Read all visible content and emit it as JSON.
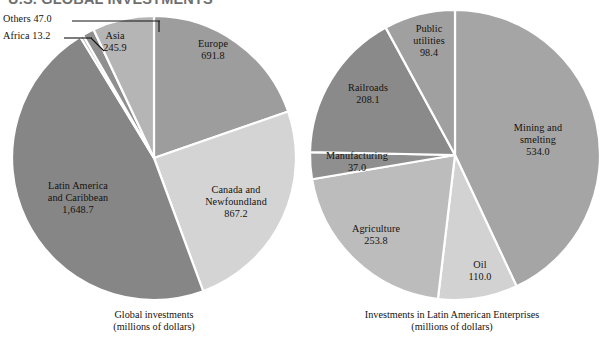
{
  "figure": {
    "title": "U.S. GLOBAL INVESTMENTS",
    "title_color": "#6f6f6f",
    "background": "#ffffff"
  },
  "chart_data": [
    {
      "type": "pie",
      "id": "global-investments",
      "title": "Global investments",
      "subtitle": "(millions of dollars)",
      "unit": "millions of dollars",
      "total": 3513.6,
      "start_angle_deg": -90,
      "direction": "clockwise",
      "center": {
        "x": 154,
        "y": 158
      },
      "radius": 142,
      "categories": [
        "Europe",
        "Canada and Newfoundland",
        "Latin America and Caribbean",
        "Africa",
        "Others",
        "Asia"
      ],
      "values": [
        691.8,
        867.2,
        1648.7,
        13.2,
        47.0,
        245.9
      ],
      "colors": [
        "#9d9d9d",
        "#d4d4d4",
        "#868686",
        "#bdbdbd",
        "#8f8f8f",
        "#b5b5b5"
      ],
      "slices": [
        {
          "label": "Europe",
          "label_line2": "",
          "value": "691.8",
          "number": 691.8,
          "color": "#9d9d9d",
          "label_placement": "inside"
        },
        {
          "label": "Canada and",
          "label_line2": "Newfoundland",
          "value": "867.2",
          "number": 867.2,
          "color": "#d4d4d4",
          "label_placement": "inside"
        },
        {
          "label": "Latin America",
          "label_line2": "and Caribbean",
          "value": "1,648.7",
          "number": 1648.7,
          "color": "#868686",
          "label_placement": "inside"
        },
        {
          "label": "Africa",
          "label_line2": "",
          "value": "13.2",
          "number": 13.2,
          "color": "#bdbdbd",
          "label_placement": "outside-left"
        },
        {
          "label": "Others",
          "label_line2": "",
          "value": "47.0",
          "number": 47.0,
          "color": "#8f8f8f",
          "label_placement": "outside-left"
        },
        {
          "label": "Asia",
          "label_line2": "",
          "value": "245.9",
          "number": 245.9,
          "color": "#b5b5b5",
          "label_placement": "inside"
        }
      ],
      "legend": "none",
      "grid": false
    },
    {
      "type": "pie",
      "id": "latin-american-enterprises",
      "title": "Investments in Latin American Enterprises",
      "subtitle": "(millions of dollars)",
      "unit": "millions of dollars",
      "total": 1241.3,
      "start_angle_deg": -90,
      "direction": "clockwise",
      "center": {
        "x": 455,
        "y": 155
      },
      "radius": 145,
      "categories": [
        "Mining and smelting",
        "Oil",
        "Agriculture",
        "Manufacturing",
        "Railroads",
        "Public utilities"
      ],
      "values": [
        534.0,
        110.0,
        253.8,
        37.0,
        208.1,
        98.4
      ],
      "colors": [
        "#a5a5a5",
        "#d2d2d2",
        "#bcbcbc",
        "#8f8f8f",
        "#8a8a8a",
        "#a0a0a0"
      ],
      "slices": [
        {
          "label": "Mining and",
          "label_line2": "smelting",
          "value": "534.0",
          "number": 534.0,
          "color": "#a5a5a5",
          "label_placement": "inside"
        },
        {
          "label": "Oil",
          "label_line2": "",
          "value": "110.0",
          "number": 110.0,
          "color": "#d2d2d2",
          "label_placement": "inside"
        },
        {
          "label": "Agriculture",
          "label_line2": "",
          "value": "253.8",
          "number": 253.8,
          "color": "#bcbcbc",
          "label_placement": "inside"
        },
        {
          "label": "Manufacturing",
          "label_line2": "",
          "value": "37.0",
          "number": 37.0,
          "color": "#8f8f8f",
          "label_placement": "inside"
        },
        {
          "label": "Railroads",
          "label_line2": "",
          "value": "208.1",
          "number": 208.1,
          "color": "#8a8a8a",
          "label_placement": "inside"
        },
        {
          "label": "Public",
          "label_line2": "utilities",
          "value": "98.4",
          "number": 98.4,
          "color": "#a0a0a0",
          "label_placement": "inside"
        }
      ],
      "legend": "none",
      "grid": false
    }
  ],
  "left_chart": {
    "caption_line1": "Global investments",
    "caption_line2": "(millions of dollars)",
    "labels": {
      "europe": {
        "line1": "Europe",
        "line2": "",
        "value": "691.8"
      },
      "canada": {
        "line1": "Canada and",
        "line2": "Newfoundland",
        "value": "867.2"
      },
      "latin_america": {
        "line1": "Latin America",
        "line2": "and Caribbean",
        "value": "1,648.7"
      },
      "asia": {
        "line1": "Asia",
        "line2": "",
        "value": "245.9"
      },
      "others": {
        "text": "Others  47.0"
      },
      "africa": {
        "text": "Africa  13.2"
      }
    }
  },
  "right_chart": {
    "caption_line1": "Investments in Latin American Enterprises",
    "caption_line2": "(millions of dollars)",
    "labels": {
      "mining": {
        "line1": "Mining and",
        "line2": "smelting",
        "value": "534.0"
      },
      "oil": {
        "line1": "Oil",
        "line2": "",
        "value": "110.0"
      },
      "agriculture": {
        "line1": "Agriculture",
        "line2": "",
        "value": "253.8"
      },
      "manufacturing": {
        "line1": "Manufacturing",
        "line2": "",
        "value": "37.0"
      },
      "railroads": {
        "line1": "Railroads",
        "line2": "",
        "value": "208.1"
      },
      "public_util": {
        "line1": "Public",
        "line2": "utilities",
        "value": "98.4"
      }
    }
  }
}
